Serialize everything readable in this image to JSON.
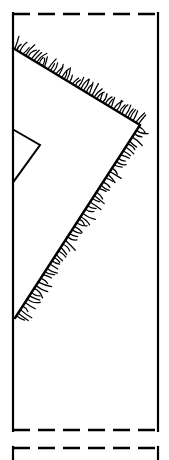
{
  "figure": {
    "title": "",
    "style": "line-drawing",
    "background_color": "#ffffff",
    "ink_color": "#000000",
    "canvas": {
      "width": 169,
      "height": 460
    }
  },
  "shapes": {
    "main_panel": {
      "name": "main-panel",
      "left_x": 13,
      "right_x": 158,
      "top_y": 14,
      "bottom_y": 430,
      "left_edge_style": "solid",
      "right_edge_style": "solid",
      "top_edge_style": "dashed",
      "bottom_edge_style": "dashed",
      "dash_length": 17,
      "dash_gap": 8
    },
    "lower_panel": {
      "name": "lower-panel-fragment",
      "left_x": 13,
      "right_x": 158,
      "top_y": 448,
      "bottom_y": 460,
      "left_edge_style": "solid",
      "right_edge_style": "solid",
      "top_edge_style": "dashed"
    },
    "upper_fracture": {
      "name": "upper-hatched-fracture-line",
      "start": {
        "x": 13,
        "y": 48
      },
      "end": {
        "x": 140,
        "y": 125
      },
      "hatch_side": "above",
      "hatch_count": 46
    },
    "lower_fracture": {
      "name": "lower-hatched-fracture-line",
      "start": {
        "x": 140,
        "y": 125
      },
      "end": {
        "x": 15,
        "y": 318
      },
      "hatch_side": "right",
      "hatch_count": 56
    },
    "notch_triangle": {
      "name": "notch-triangle",
      "points": [
        {
          "x": 14,
          "y": 130
        },
        {
          "x": 40,
          "y": 145
        },
        {
          "x": 14,
          "y": 181
        }
      ],
      "closed_on_left_edge": true
    }
  },
  "labels": {
    "figure_caption": "",
    "reference_numerals": []
  }
}
